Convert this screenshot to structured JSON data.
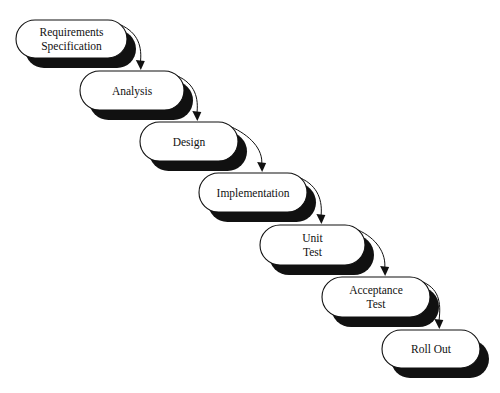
{
  "diagram": {
    "type": "waterfall-process",
    "colors": {
      "box_fill": "#ffffff",
      "box_stroke": "#111111",
      "shadow": "#111111",
      "text": "#111111",
      "background": "#ffffff"
    },
    "stages": [
      {
        "id": "requirements",
        "lines": [
          "Requirements",
          "Specification"
        ],
        "x": 16,
        "y": 20,
        "w": 111,
        "h": 38
      },
      {
        "id": "analysis",
        "lines": [
          "Analysis"
        ],
        "x": 80,
        "y": 71,
        "w": 104,
        "h": 39
      },
      {
        "id": "design",
        "lines": [
          "Design"
        ],
        "x": 140,
        "y": 122,
        "w": 98,
        "h": 39
      },
      {
        "id": "implementation",
        "lines": [
          "Implementation"
        ],
        "x": 199,
        "y": 173,
        "w": 108,
        "h": 39
      },
      {
        "id": "unit-test",
        "lines": [
          "Unit",
          "Test"
        ],
        "x": 260,
        "y": 225,
        "w": 105,
        "h": 40
      },
      {
        "id": "acceptance-test",
        "lines": [
          "Acceptance",
          "Test"
        ],
        "x": 322,
        "y": 277,
        "w": 108,
        "h": 40
      },
      {
        "id": "roll-out",
        "lines": [
          "Roll Out"
        ],
        "x": 382,
        "y": 330,
        "w": 98,
        "h": 38
      }
    ],
    "shadow_offset": {
      "dx": 9,
      "dy": 10
    },
    "flows": [
      {
        "from": "requirements",
        "to": "analysis"
      },
      {
        "from": "analysis",
        "to": "design"
      },
      {
        "from": "design",
        "to": "implementation"
      },
      {
        "from": "implementation",
        "to": "unit-test"
      },
      {
        "from": "unit-test",
        "to": "acceptance-test"
      },
      {
        "from": "acceptance-test",
        "to": "roll-out"
      }
    ]
  }
}
